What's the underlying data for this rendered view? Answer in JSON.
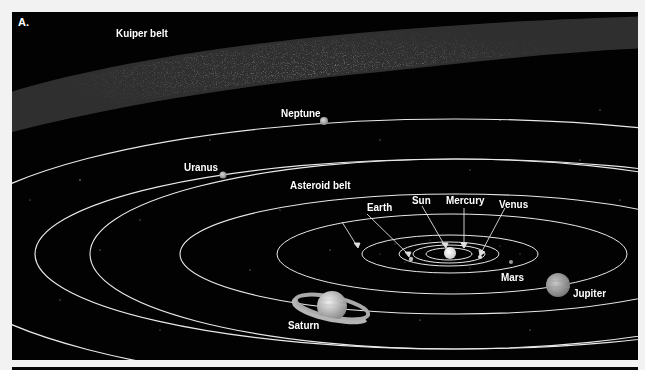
{
  "figure": {
    "panel_label": "A.",
    "background_color": "#020202",
    "orbit_color": "#e8e8e8"
  },
  "labels": {
    "kuiper_belt": "Kuiper belt",
    "neptune": "Neptune",
    "uranus": "Uranus",
    "asteroid_belt": "Asteroid belt",
    "earth": "Earth",
    "sun": "Sun",
    "mercury": "Mercury",
    "venus": "Venus",
    "mars": "Mars",
    "jupiter": "Jupiter",
    "saturn": "Saturn"
  }
}
